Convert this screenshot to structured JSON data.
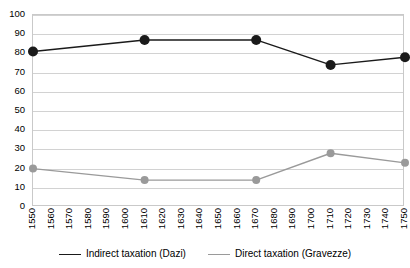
{
  "chart_data": {
    "type": "line",
    "title": "",
    "subtitle": "",
    "xlabel": "",
    "ylabel": "",
    "xlim": [
      1550,
      1750
    ],
    "ylim": [
      0,
      100
    ],
    "ytick_step": 10,
    "xtick_step": 10,
    "grid": true,
    "grid_axis": "y",
    "legend_position": "bottom-center",
    "categories": [
      1550,
      1560,
      1570,
      1580,
      1590,
      1600,
      1610,
      1620,
      1630,
      1640,
      1650,
      1660,
      1670,
      1680,
      1690,
      1700,
      1710,
      1720,
      1730,
      1740,
      1750
    ],
    "ytick_labels": [
      "0",
      "10",
      "20",
      "30",
      "40",
      "50",
      "60",
      "70",
      "80",
      "90",
      "100"
    ],
    "ytick_values": [
      0,
      10,
      20,
      30,
      40,
      50,
      60,
      70,
      80,
      90,
      100
    ],
    "xtick_labels": [
      "1550",
      "1560",
      "1570",
      "1580",
      "1590",
      "1600",
      "1610",
      "1620",
      "1630",
      "1640",
      "1650",
      "1660",
      "1670",
      "1680",
      "1690",
      "1700",
      "1710",
      "1720",
      "1730",
      "1740",
      "1750"
    ],
    "series": [
      {
        "name": "Indirect taxation (Dazi)",
        "color": "#1a1a1a",
        "marker": "circle",
        "marker_size": 5,
        "x": [
          1550,
          1610,
          1670,
          1710,
          1750
        ],
        "values": [
          81,
          87,
          87,
          74,
          78
        ]
      },
      {
        "name": "Direct taxation (Gravezze)",
        "color": "#9a9a9a",
        "marker": "circle",
        "marker_size": 4,
        "x": [
          1550,
          1610,
          1670,
          1710,
          1750
        ],
        "values": [
          20,
          14,
          14,
          28,
          23
        ]
      }
    ]
  },
  "legend": {
    "items": [
      {
        "label": "Indirect taxation (Dazi)",
        "color": "#1a1a1a"
      },
      {
        "label": "Direct taxation (Gravezze)",
        "color": "#9a9a9a"
      }
    ]
  },
  "colors": {
    "indirect_taxation": "#1a1a1a",
    "direct_taxation": "#9a9a9a",
    "gridline": "#d2d2d2",
    "plot_border": "#c9c9c9",
    "background": "#ffffff",
    "text": "#000000"
  }
}
